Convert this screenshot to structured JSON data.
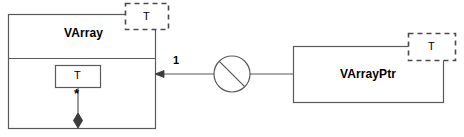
{
  "diagram": {
    "stroke_color": "#5a5a5a",
    "fill_color": "#ffffff",
    "text_color": "#000000",
    "classes": [
      {
        "id": "varray",
        "name": "VArray",
        "template_parameter": "T",
        "compartments": [
          "name",
          "body"
        ],
        "attribute_box_label": "T",
        "composition_multiplicity": "*"
      },
      {
        "id": "varrayptr",
        "name": "VArrayPtr",
        "template_parameter": "T"
      }
    ],
    "association": {
      "source_multiplicity": "1",
      "arrow_direction": "left",
      "connector_icon": "circle-with-slash-icon"
    }
  }
}
